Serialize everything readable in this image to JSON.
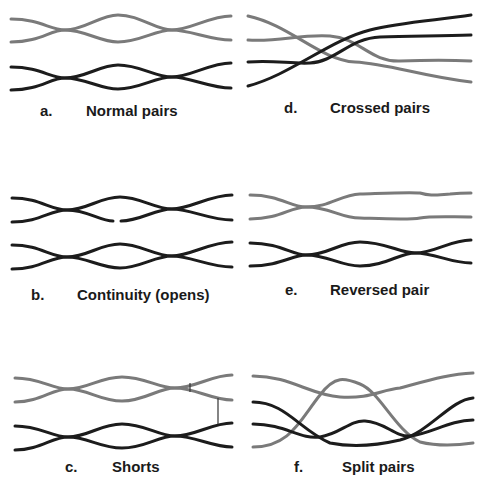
{
  "figure": {
    "panels": [
      {
        "letter": "a.",
        "title": "Normal pairs"
      },
      {
        "letter": "b.",
        "title": "Continuity (opens)"
      },
      {
        "letter": "c.",
        "title": "Shorts"
      },
      {
        "letter": "d.",
        "title": "Crossed pairs"
      },
      {
        "letter": "e.",
        "title": "Reversed pair"
      },
      {
        "letter": "f.",
        "title": "Split pairs"
      }
    ],
    "colors": {
      "pair_gray": "#7a7a7a",
      "pair_black": "#1c1c1c",
      "background": "#ffffff"
    }
  }
}
